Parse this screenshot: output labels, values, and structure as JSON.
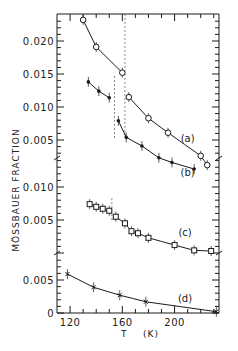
{
  "chart_data": {
    "type": "scatter",
    "title": "",
    "xlabel": "T    (K)",
    "ylabel": "MÖSSBAUER FRACTION",
    "xlim": [
      110,
      234
    ],
    "x_ticks": [
      120,
      160,
      200
    ],
    "x_minor_step": 10,
    "grid": false,
    "panels": [
      {
        "name": "top",
        "series_names": [
          "(a)",
          "(b)"
        ],
        "ylim": [
          0.0,
          0.0245
        ],
        "y_ticks": [
          {
            "value": 0.02,
            "label": "0.020"
          },
          {
            "value": 0.015,
            "label": "0.015"
          },
          {
            "value": 0.01,
            "label": "0.010"
          },
          {
            "value": 0.005,
            "label": "0.005"
          }
        ]
      },
      {
        "name": "middle",
        "series_names": [
          "(c)"
        ],
        "ylim": [
          0.0,
          0.0123
        ],
        "y_ticks": [
          {
            "value": 0.01,
            "label": "0.010"
          },
          {
            "value": 0.005,
            "label": "0.005"
          }
        ]
      },
      {
        "name": "bottom",
        "series_names": [
          "(d)"
        ],
        "ylim": [
          0.0,
          0.0099
        ],
        "y_ticks": [
          {
            "value": 0.01,
            "label": "0.010"
          },
          {
            "value": 0.005,
            "label": "0.005"
          },
          {
            "value": 0.0,
            "label": "0"
          }
        ]
      }
    ],
    "series": [
      {
        "name": "(a)",
        "panel": "top",
        "marker": "open-circle",
        "x": [
          130,
          140,
          160,
          165,
          180,
          195,
          220,
          225
        ],
        "y": [
          0.0232,
          0.0191,
          0.0152,
          0.0115,
          0.0083,
          0.0061,
          0.0026,
          0.0012
        ],
        "break_at": 162,
        "label_at": {
          "x": 210,
          "y": 0.0047
        }
      },
      {
        "name": "(b)",
        "panel": "top",
        "marker": "filled-circle",
        "x": [
          134,
          142,
          150,
          157,
          163,
          175,
          188,
          198,
          215
        ],
        "y": [
          0.0138,
          0.0124,
          0.0114,
          0.0079,
          0.0054,
          0.0041,
          0.0023,
          0.0016,
          0.0006
        ],
        "break_at": 154,
        "label_at": {
          "x": 210,
          "y": -0.0005
        }
      },
      {
        "name": "(c)",
        "panel": "middle",
        "marker": "open-square",
        "x": [
          135,
          140,
          145,
          150,
          155,
          162,
          167,
          172,
          180,
          200,
          215,
          228
        ],
        "y": [
          0.0074,
          0.007,
          0.0067,
          0.0064,
          0.0055,
          0.0045,
          0.0033,
          0.003,
          0.0023,
          0.0012,
          0.0004,
          0.0003
        ],
        "break_at": 152,
        "label_at": {
          "x": 208,
          "y": 0.0026
        }
      },
      {
        "name": "(d)",
        "panel": "bottom",
        "marker": "cross",
        "x": [
          118,
          138,
          158,
          178,
          232
        ],
        "y": [
          0.0059,
          0.0039,
          0.0027,
          0.0017,
          0.0002
        ],
        "label_at": {
          "x": 208,
          "y": 0.0016
        }
      }
    ]
  }
}
